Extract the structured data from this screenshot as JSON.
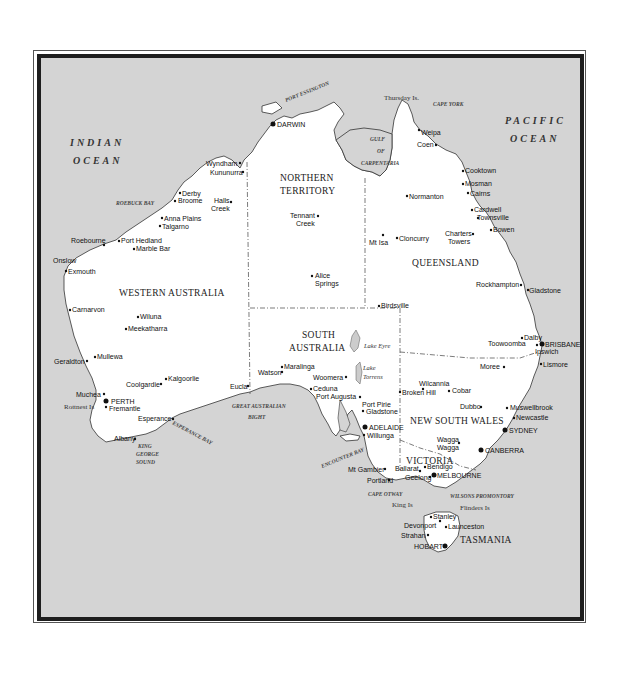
{
  "map": {
    "title": "Australia",
    "colors": {
      "ocean": "#d4d4d4",
      "land": "#ffffff",
      "frame": "#1e1e1e"
    },
    "oceans": [
      {
        "name": "INDIAN",
        "line2": "OCEAN"
      },
      {
        "name": "PACIFIC",
        "line2": "OCEAN"
      }
    ],
    "states": {
      "wa": "WESTERN AUSTRALIA",
      "nt1": "NORTHERN",
      "nt2": "TERRITORY",
      "qld": "QUEENSLAND",
      "sa1": "SOUTH",
      "sa2": "AUSTRALIA",
      "nsw": "NEW SOUTH WALES",
      "vic": "VICTORIA",
      "tas": "TASMANIA"
    },
    "water_features": {
      "port_essington": "PORT ESSINGTON",
      "gulf1": "GULF",
      "gulf2": "OF",
      "gulf3": "CARPENTARIA",
      "roebuck": "ROEBUCK BAY",
      "gab1": "GREAT AUSTRALIAN",
      "gab2": "BIGHT",
      "esperance_bay": "ESPERANCE BAY",
      "kgs1": "KING",
      "kgs2": "GEORGE",
      "kgs3": "SOUND",
      "encounter": "ENCOUNTER BAY",
      "cape_otway": "CAPE OTWAY",
      "wilsons": "WILSONS PROMONTORY",
      "cape_york": "CAPE YORK",
      "thursday": "Thursday Is.",
      "king_is": "King Is",
      "flinders_is": "Flinders Is",
      "rottnest": "Rottnest Is"
    },
    "lakes": {
      "eyre": "Lake Eyre",
      "torrens1": "Lake",
      "torrens2": "Torrens"
    },
    "capitals": {
      "darwin": "DARWIN",
      "perth": "PERTH",
      "brisbane": "BRISBANE",
      "sydney": "SYDNEY",
      "canberra": "CANBERRA",
      "adelaide": "ADELAIDE",
      "melbourne": "MELBOURNE",
      "hobart": "HOBART"
    },
    "towns": {
      "wyndham": "Wyndham",
      "kununurra": "Kununurra",
      "derby": "Derby",
      "broome": "Broome",
      "halls1": "Halls",
      "halls2": "Creek",
      "anna": "Anna Plains",
      "talgarno": "Talgarno",
      "roebourne": "Roebourne",
      "porthedland": "Port Hedland",
      "marblebar": "Marble Bar",
      "onslow": "Onslow",
      "exmouth": "Exmouth",
      "carnarvon": "Carnarvon",
      "wiluna": "Wiluna",
      "meekatharra": "Meekatharra",
      "geraldton": "Geraldton",
      "mullewa": "Mullewa",
      "muchea": "Muchea",
      "fremantle": "Fremantle",
      "coolgardie": "Coolgardie",
      "kalgoorlie": "Kalgoorlie",
      "esperance": "Esperance",
      "albany": "Albany",
      "eucla": "Eucla",
      "tennant1": "Tennant",
      "tennant2": "Creek",
      "alice1": "Alice",
      "alice2": "Springs",
      "weipa": "Weipa",
      "coen": "Coen",
      "cooktown": "Cooktown",
      "mosman": "Mosman",
      "cairns": "Cairns",
      "cardwell": "Cardwell",
      "townsville": "Townsville",
      "bowen": "Bowen",
      "normanton": "Normanton",
      "mtisa": "Mt Isa",
      "cloncurry": "Cloncurry",
      "charters1": "Charters",
      "charters2": "Towers",
      "rockhampton": "Rockhampton",
      "gladstone_q": "Gladstone",
      "birdsville": "Birdsville",
      "dalby": "Dalby",
      "toowoomba": "Toowoomba",
      "ipswich": "Ipswich",
      "lismore": "Lismore",
      "moree": "Moree",
      "maralinga": "Maralinga",
      "watson": "Watson",
      "woomera": "Woomera",
      "ceduna": "Ceduna",
      "portaugusta": "Port Augusta",
      "portpirie": "Port Pirie",
      "gladstone_s": "Gladstone",
      "willunga": "Willunga",
      "wilcannia": "Wilcannia",
      "brokenhill": "Broken Hill",
      "cobar": "Cobar",
      "dubbo": "Dubbo",
      "muswellbrook": "Muswellbrook",
      "newcastle": "Newcastle",
      "wagga1": "Wagga",
      "wagga2": "Wagga",
      "mtgambier": "Mt Gambier",
      "portland": "Portland",
      "ballarat": "Ballarat",
      "bendigo": "Bendigo",
      "geelong": "Geelong",
      "stanley": "Stanley",
      "devonport": "Devonport",
      "launceston": "Launceston",
      "strahan": "Strahan"
    }
  }
}
